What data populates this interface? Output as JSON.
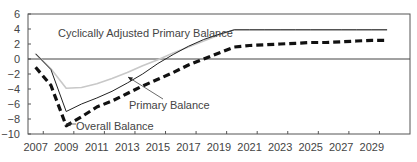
{
  "chart_data": {
    "type": "line",
    "title": "",
    "xlabel": "",
    "ylabel": "",
    "ylim": [
      -10,
      6
    ],
    "yticks": [
      6,
      4,
      2,
      0,
      -2,
      -4,
      -6,
      -8,
      -10
    ],
    "xticks_labels": [
      "2007",
      "2009",
      "2011",
      "2013",
      "2015",
      "2017",
      "2019",
      "2021",
      "2023",
      "2025",
      "2027",
      "2029"
    ],
    "x": [
      2007,
      2008,
      2009,
      2010,
      2011,
      2012,
      2013,
      2014,
      2015,
      2016,
      2017,
      2018,
      2019,
      2020,
      2021,
      2022,
      2023,
      2024,
      2025,
      2026,
      2027,
      2028,
      2029,
      2030
    ],
    "grid": false,
    "zero_line": true,
    "legend": "inline annotations",
    "series": [
      {
        "name": "Cyclically Adjusted Primary Balance",
        "style": "solid-light-gray",
        "color": "#c8c8c8",
        "values": [
          0.7,
          -1.3,
          -3.9,
          -3.8,
          -3.3,
          -2.6,
          -1.8,
          -0.9,
          -0.1,
          0.8,
          1.6,
          2.4,
          3.2,
          3.9,
          3.9,
          3.9,
          3.9,
          3.9,
          3.9,
          3.9,
          3.9,
          3.9,
          3.9,
          3.9
        ]
      },
      {
        "name": "Primary Balance",
        "style": "solid-thin-black",
        "color": "#222222",
        "values": [
          0.7,
          -1.4,
          -7.0,
          -6.0,
          -5.2,
          -4.3,
          -3.2,
          -2.0,
          -0.6,
          0.6,
          1.7,
          2.6,
          3.3,
          3.9,
          3.9,
          3.9,
          3.9,
          3.9,
          3.9,
          3.9,
          3.9,
          3.9,
          3.9,
          3.9
        ]
      },
      {
        "name": "Overall Balance",
        "style": "dashed-thick-black",
        "color": "#111111",
        "values": [
          -1.1,
          -3.5,
          -8.9,
          -7.7,
          -6.4,
          -5.6,
          -4.6,
          -3.6,
          -2.7,
          -1.8,
          -0.8,
          0.0,
          0.8,
          1.6,
          1.8,
          1.9,
          2.0,
          2.1,
          2.2,
          2.2,
          2.3,
          2.4,
          2.5,
          2.5
        ]
      }
    ],
    "annotations": [
      {
        "text": "Cyclically Adjusted Primary Balance",
        "x": 58,
        "y": 37
      },
      {
        "text": "Primary Balance",
        "x": 129,
        "y": 109,
        "arrow_to": [
          128,
          77
        ]
      },
      {
        "text": "Overall Balance",
        "x": 76,
        "y": 130,
        "arrow_to": [
          66,
          124
        ]
      }
    ]
  }
}
